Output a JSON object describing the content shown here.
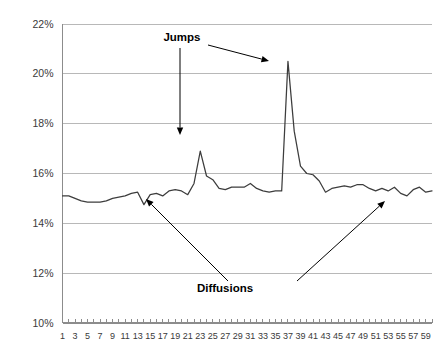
{
  "chart_data": {
    "type": "line",
    "title": "",
    "xlabel": "",
    "ylabel": "",
    "ylim": [
      10,
      22
    ],
    "xlim": [
      1,
      60
    ],
    "grid": true,
    "legend": "none",
    "y_tick_labels": [
      "22%",
      "20%",
      "18%",
      "16%",
      "14%",
      "12%",
      "10%"
    ],
    "y_tick_values": [
      22,
      20,
      18,
      16,
      14,
      12,
      10
    ],
    "x_tick_labels": [
      "1",
      "3",
      "5",
      "7",
      "9",
      "11",
      "13",
      "15",
      "17",
      "19",
      "21",
      "23",
      "25",
      "27",
      "29",
      "31",
      "33",
      "35",
      "37",
      "39",
      "41",
      "43",
      "45",
      "47",
      "49",
      "51",
      "53",
      "55",
      "57",
      "59"
    ],
    "x_tick_values": [
      1,
      3,
      5,
      7,
      9,
      11,
      13,
      15,
      17,
      19,
      21,
      23,
      25,
      27,
      29,
      31,
      33,
      35,
      37,
      39,
      41,
      43,
      45,
      47,
      49,
      51,
      53,
      55,
      57,
      59
    ],
    "x": [
      1,
      2,
      3,
      4,
      5,
      6,
      7,
      8,
      9,
      10,
      11,
      12,
      13,
      14,
      15,
      16,
      17,
      18,
      19,
      20,
      21,
      22,
      23,
      24,
      25,
      26,
      27,
      28,
      29,
      30,
      31,
      32,
      33,
      34,
      35,
      36,
      37,
      38,
      39,
      40,
      41,
      42,
      43,
      44,
      45,
      46,
      47,
      48,
      49,
      50,
      51,
      52,
      53,
      54,
      55,
      56,
      57,
      58,
      59,
      60
    ],
    "series": [
      {
        "name": "volatility",
        "values": [
          15.1,
          15.1,
          15.0,
          14.9,
          14.85,
          14.85,
          14.85,
          14.9,
          15.0,
          15.05,
          15.1,
          15.2,
          15.25,
          14.75,
          15.15,
          15.2,
          15.1,
          15.3,
          15.35,
          15.3,
          15.15,
          15.6,
          16.9,
          15.9,
          15.75,
          15.4,
          15.35,
          15.45,
          15.45,
          15.45,
          15.6,
          15.4,
          15.3,
          15.25,
          15.3,
          15.3,
          20.5,
          17.7,
          16.3,
          16.0,
          15.95,
          15.7,
          15.25,
          15.4,
          15.45,
          15.5,
          15.45,
          15.55,
          15.55,
          15.4,
          15.3,
          15.4,
          15.3,
          15.45,
          15.2,
          15.1,
          15.35,
          15.45,
          15.25,
          15.3
        ]
      }
    ],
    "annotations": [
      {
        "id": "jumps",
        "text": "Jumps",
        "text_x": 182,
        "text_y": 41,
        "arrows": [
          {
            "from_x": 180,
            "from_y": 48,
            "to_x": 180,
            "to_y": 135
          },
          {
            "from_x": 208,
            "from_y": 45,
            "to_x": 269,
            "to_y": 61
          }
        ]
      },
      {
        "id": "diffusions",
        "text": "Diffusions",
        "text_x": 225,
        "text_y": 292,
        "arrows": [
          {
            "from_x": 228,
            "from_y": 281,
            "to_x": 146,
            "to_y": 199
          },
          {
            "from_x": 297,
            "from_y": 281,
            "to_x": 385,
            "to_y": 201
          }
        ]
      }
    ]
  }
}
